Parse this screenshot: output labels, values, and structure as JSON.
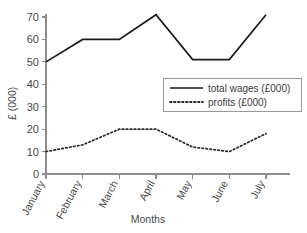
{
  "chart_data": {
    "type": "line",
    "title": "",
    "title_fragment_visible": "",
    "xlabel": "Months",
    "ylabel": "£ (000)",
    "categories": [
      "January",
      "February",
      "March",
      "April",
      "May",
      "June",
      "July"
    ],
    "ylim": [
      0,
      70
    ],
    "ytick_labels": [
      "0",
      "10",
      "20",
      "30",
      "40",
      "50",
      "60",
      "70"
    ],
    "ytick_values": [
      0,
      10,
      20,
      30,
      40,
      50,
      60,
      70
    ],
    "grid": false,
    "legend_position": "center-right",
    "series": [
      {
        "name": "total wages (£000)",
        "style": "solid",
        "color": "#1a1a1a",
        "values": [
          50,
          60,
          60,
          71,
          51,
          51,
          71
        ]
      },
      {
        "name": "profits (£000)",
        "style": "dotted",
        "color": "#2b2b2b",
        "values": [
          10,
          13,
          20,
          20,
          12,
          10,
          18
        ]
      }
    ]
  },
  "legend": {
    "items": [
      {
        "label": "total wages (£000)",
        "style": "solid"
      },
      {
        "label": "profits (£000)",
        "style": "dotted"
      }
    ]
  },
  "axes": {
    "y_title": "£ (000)",
    "x_title": "Months"
  }
}
